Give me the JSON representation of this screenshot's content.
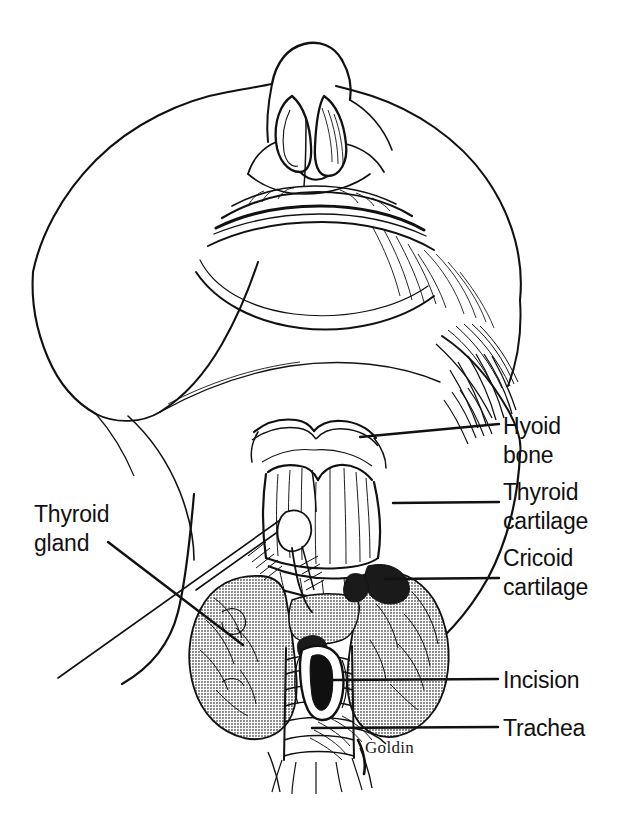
{
  "figure": {
    "kind": "anatomical-line-illustration",
    "width": 621,
    "height": 819,
    "background_color": "#ffffff",
    "ink_color": "#111111",
    "gland_shading_color": "#9a9a9a",
    "signature": "Goldin"
  },
  "labels": [
    {
      "id": "hyoid-bone",
      "text_line_1": "Hyoid",
      "text_line_2": "bone",
      "x": 503,
      "y": 412,
      "leader": {
        "x1": 360,
        "y1": 437,
        "x2": 499,
        "y2": 424
      }
    },
    {
      "id": "thyroid-cartilage",
      "text_line_1": "Thyroid",
      "text_line_2": "cartilage",
      "x": 503,
      "y": 478,
      "leader": {
        "x1": 393,
        "y1": 503,
        "x2": 499,
        "y2": 502
      }
    },
    {
      "id": "cricoid-cartilage",
      "text_line_1": "Cricoid",
      "text_line_2": "cartilage",
      "x": 503,
      "y": 544,
      "leader": {
        "x1": 385,
        "y1": 579,
        "x2": 499,
        "y2": 578
      }
    },
    {
      "id": "incision",
      "text_line_1": "Incision",
      "text_line_2": "",
      "x": 503,
      "y": 666,
      "leader": {
        "x1": 332,
        "y1": 680,
        "x2": 498,
        "y2": 679
      }
    },
    {
      "id": "trachea",
      "text_line_1": "Trachea",
      "text_line_2": "",
      "x": 503,
      "y": 714,
      "leader": {
        "x1": 312,
        "y1": 728,
        "x2": 498,
        "y2": 727
      }
    },
    {
      "id": "thyroid-gland",
      "text_line_1": "Thyroid",
      "text_line_2": "gland",
      "x": 34,
      "y": 500,
      "leader": {
        "x1": 108,
        "y1": 542,
        "x2": 243,
        "y2": 645
      }
    }
  ],
  "signature_pos": {
    "x": 365,
    "y": 738
  }
}
